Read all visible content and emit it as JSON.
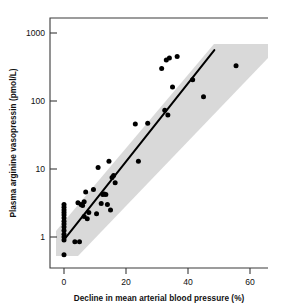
{
  "chart_data": {
    "type": "scatter",
    "title": "",
    "xlabel": "Decline in mean arterial blood pressure (%)",
    "ylabel": "Plasma arginine vasopressin (pmol/L)",
    "xlim": [
      -3,
      65
    ],
    "ylim": [
      0.5,
      2000
    ],
    "yscale": "log",
    "xticks": [
      0,
      20,
      40,
      60
    ],
    "xtick_labels": [
      "0",
      "20",
      "40",
      "60"
    ],
    "yticks": [
      1,
      10,
      100,
      1000
    ],
    "ytick_labels": [
      "1",
      "10",
      "100",
      "1000"
    ],
    "grid": false,
    "legend": null,
    "annotations": [],
    "series": [
      {
        "name": "Subjects",
        "marker": "filled-circle",
        "color": "#000000",
        "points": [
          [
            0,
            0.55
          ],
          [
            0,
            0.9
          ],
          [
            0,
            1.0
          ],
          [
            0,
            1.1
          ],
          [
            0,
            1.25
          ],
          [
            0,
            1.4
          ],
          [
            0,
            1.55
          ],
          [
            0,
            1.7
          ],
          [
            0,
            1.9
          ],
          [
            0,
            2.1
          ],
          [
            0,
            2.3
          ],
          [
            0,
            2.5
          ],
          [
            0,
            2.75
          ],
          [
            0,
            3.0
          ],
          [
            3.5,
            0.85
          ],
          [
            5.0,
            0.85
          ],
          [
            4.5,
            3.2
          ],
          [
            5.5,
            3.0
          ],
          [
            6.0,
            2.9
          ],
          [
            6.5,
            2.0
          ],
          [
            7.5,
            1.85
          ],
          [
            6.5,
            3.3
          ],
          [
            7.0,
            4.6
          ],
          [
            8.0,
            2.3
          ],
          [
            9.5,
            5.0
          ],
          [
            10.5,
            2.2
          ],
          [
            11.0,
            10.5
          ],
          [
            12.0,
            3.1
          ],
          [
            12.5,
            4.2
          ],
          [
            13.0,
            4.3
          ],
          [
            13.5,
            4.2
          ],
          [
            14.0,
            3.0
          ],
          [
            14.5,
            13.0
          ],
          [
            15.0,
            2.5
          ],
          [
            15.5,
            7.5
          ],
          [
            16.0,
            8.0
          ],
          [
            16.5,
            6.3
          ],
          [
            23.0,
            46.0
          ],
          [
            24.0,
            13.0
          ],
          [
            27.0,
            47.0
          ],
          [
            31.5,
            300.0
          ],
          [
            32.5,
            73.0
          ],
          [
            33.5,
            62.0
          ],
          [
            33.0,
            400.0
          ],
          [
            34.0,
            430.0
          ],
          [
            35.0,
            160.0
          ],
          [
            36.5,
            450.0
          ],
          [
            41.5,
            205.0
          ],
          [
            45.0,
            115.0
          ],
          [
            55.5,
            330.0
          ]
        ]
      }
    ],
    "regression_line": {
      "name": "fitted regression line",
      "color": "#000000",
      "x_start": 0.3,
      "y_start": 0.95,
      "x_end": 48.5,
      "y_end": 560.0
    },
    "confidence_band": {
      "name": "shaded confidence band",
      "color": "#d9d9d9",
      "description": "grey shaded band around the regression line"
    }
  },
  "axes": {
    "x_title": "Decline in mean arterial blood pressure (%)",
    "y_title": "Plasma arginine vasopressin (pmol/L)"
  }
}
